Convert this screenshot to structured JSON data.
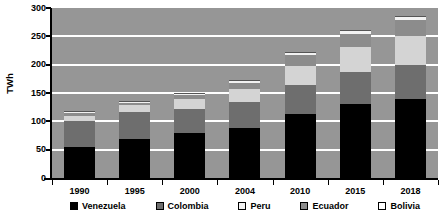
{
  "chart_data": {
    "type": "bar",
    "stacked": true,
    "title": "",
    "subtitle": "",
    "xlabel": "",
    "ylabel": "TWh",
    "ylim": [
      0,
      300
    ],
    "ytick_step": 50,
    "ytick_labels": [
      "300",
      "250",
      "200",
      "150",
      "100",
      "50",
      "0"
    ],
    "ytick_values": [
      300,
      250,
      200,
      150,
      100,
      50,
      0
    ],
    "grid": true,
    "grid_axis": "y",
    "grid_color": "#ffffff",
    "plot_background": "#969696",
    "legend_position": "bottom",
    "categories": [
      "1990",
      "1995",
      "2000",
      "2004",
      "2010",
      "2015",
      "2018"
    ],
    "series": [
      {
        "name": "Venezuela",
        "color": "#000000",
        "values": [
          55,
          68,
          79,
          88,
          113,
          130,
          140
        ]
      },
      {
        "name": "Colombia",
        "color": "#6e6e6e",
        "values": [
          45,
          48,
          43,
          47,
          52,
          57,
          60
        ]
      },
      {
        "name": "Peru",
        "color": "#d4d4d4",
        "values": [
          10,
          12,
          17,
          22,
          33,
          44,
          50
        ]
      },
      {
        "name": "Ecuador",
        "color": "#8c8c8c",
        "values": [
          5,
          5,
          7,
          11,
          19,
          24,
          28
        ]
      },
      {
        "name": "Bolivia",
        "color": "#f2f2f2",
        "values": [
          3,
          3,
          4,
          5,
          6,
          7,
          8
        ]
      }
    ],
    "totals": [
      118,
      136,
      150,
      173,
      223,
      262,
      286
    ]
  },
  "legend": {
    "entries": [
      {
        "label": "Venezuela",
        "color": "#000000"
      },
      {
        "label": "Colombia",
        "color": "#6e6e6e"
      },
      {
        "label": "Peru",
        "color": "#f2f2f2"
      },
      {
        "label": "Ecuador",
        "color": "#8c8c8c"
      },
      {
        "label": "Bolivia",
        "color": "#ffffff"
      }
    ]
  },
  "axes": {
    "y_title": "TWh",
    "zero_label": "0"
  }
}
